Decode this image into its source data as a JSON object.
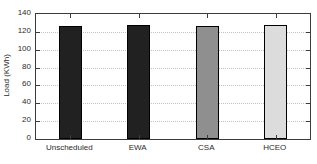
{
  "figure": {
    "background": "#ffffff",
    "axis_color": "#3c3c3c",
    "grid_color": "#c2c2c2",
    "text_color": "#2b2b2b"
  },
  "chart_data": {
    "type": "bar",
    "title": "",
    "xlabel": "",
    "ylabel": "Load (KWh)",
    "categories": [
      "Unscheduled",
      "EWA",
      "CSA",
      "HCEO"
    ],
    "values": [
      127,
      128,
      127,
      128
    ],
    "bar_colors": [
      "#212121",
      "#212121",
      "#8f8f8f",
      "#dcdcdc"
    ],
    "bar_edge_color": "#000000",
    "ylim": [
      0,
      140
    ],
    "yticks": [
      0,
      20,
      40,
      60,
      80,
      100,
      120,
      140
    ],
    "grid": true,
    "legend_position": "none"
  }
}
